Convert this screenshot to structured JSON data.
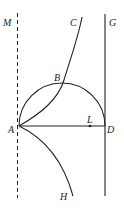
{
  "labels": {
    "M": "M",
    "C": "C",
    "G": "G",
    "B": "B",
    "A": "A",
    "L": "L",
    "D": "D",
    "H": "H"
  },
  "colors": {
    "stroke": "#222222",
    "background": "#ffffff"
  }
}
